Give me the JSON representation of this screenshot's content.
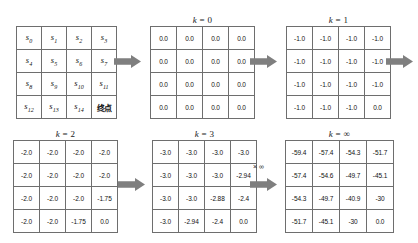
{
  "figure": {
    "panels": [
      {
        "id": "states",
        "caption": "",
        "caption_var": "",
        "caption_rest": "",
        "kind": "states",
        "rows": [
          [
            "s0",
            "s1",
            "s2",
            "s3"
          ],
          [
            "s4",
            "s5",
            "s6",
            "s7"
          ],
          [
            "s8",
            "s9",
            "s10",
            "s11"
          ],
          [
            "s12",
            "s13",
            "s14",
            "终点"
          ]
        ],
        "cells": [
          [
            {
              "base": "s",
              "sub": "0"
            },
            {
              "base": "s",
              "sub": "1"
            },
            {
              "base": "s",
              "sub": "2"
            },
            {
              "base": "s",
              "sub": "3"
            }
          ],
          [
            {
              "base": "s",
              "sub": "4"
            },
            {
              "base": "s",
              "sub": "5"
            },
            {
              "base": "s",
              "sub": "6"
            },
            {
              "base": "s",
              "sub": "7"
            }
          ],
          [
            {
              "base": "s",
              "sub": "8"
            },
            {
              "base": "s",
              "sub": "9"
            },
            {
              "base": "s",
              "sub": "10"
            },
            {
              "base": "s",
              "sub": "11"
            }
          ],
          [
            {
              "base": "s",
              "sub": "12"
            },
            {
              "base": "s",
              "sub": "13"
            },
            {
              "base": "s",
              "sub": "14"
            },
            {
              "base": "终点",
              "sub": ""
            }
          ]
        ]
      },
      {
        "id": "k0",
        "caption": "k = 0",
        "caption_var": "k",
        "caption_rest": " = 0",
        "kind": "values",
        "rows": [
          [
            "0.0",
            "0.0",
            "0.0",
            "0.0"
          ],
          [
            "0.0",
            "0.0",
            "0.0",
            "0.0"
          ],
          [
            "0.0",
            "0.0",
            "0.0",
            "0.0"
          ],
          [
            "0.0",
            "0.0",
            "0.0",
            "0.0"
          ]
        ]
      },
      {
        "id": "k1",
        "caption": "k = 1",
        "caption_var": "k",
        "caption_rest": " = 1",
        "kind": "values",
        "rows": [
          [
            "-1.0",
            "-1.0",
            "-1.0",
            "-1.0"
          ],
          [
            "-1.0",
            "-1.0",
            "-1.0",
            "-1.0"
          ],
          [
            "-1.0",
            "-1.0",
            "-1.0",
            "-1.0"
          ],
          [
            "-1.0",
            "-1.0",
            "-1.0",
            "0.0"
          ]
        ]
      },
      {
        "id": "k2",
        "caption": "k = 2",
        "caption_var": "k",
        "caption_rest": " = 2",
        "kind": "values",
        "rows": [
          [
            "-2.0",
            "-2.0",
            "-2.0",
            "-2.0"
          ],
          [
            "-2.0",
            "-2.0",
            "-2.0",
            "-2.0"
          ],
          [
            "-2.0",
            "-2.0",
            "-2.0",
            "-1.75"
          ],
          [
            "-2.0",
            "-2.0",
            "-1.75",
            "0.0"
          ]
        ]
      },
      {
        "id": "k3",
        "caption": "k = 3",
        "caption_var": "k",
        "caption_rest": " = 3",
        "kind": "values",
        "rows": [
          [
            "-3.0",
            "-3.0",
            "-3.0",
            "-3.0"
          ],
          [
            "-3.0",
            "-3.0",
            "-3.0",
            "-2.94"
          ],
          [
            "-3.0",
            "-3.0",
            "-2.88",
            "-2.4"
          ],
          [
            "-3.0",
            "-2.94",
            "-2.4",
            "0.0"
          ]
        ]
      },
      {
        "id": "kinf",
        "caption": "k = ∞",
        "caption_var": "k",
        "caption_rest": " = ∞",
        "kind": "values",
        "rows": [
          [
            "-59.4",
            "-57.4",
            "-54.3",
            "-51.7"
          ],
          [
            "-57.4",
            "-54.6",
            "-49.7",
            "-45.1"
          ],
          [
            "-54.3",
            "-49.7",
            "-40.9",
            "-30"
          ],
          [
            "-51.7",
            "-45.1",
            "-30",
            "0.0"
          ]
        ]
      }
    ],
    "arrows": [
      {
        "id": "arrow-states-to-k0",
        "label": ""
      },
      {
        "id": "arrow-k0-to-k1",
        "label": ""
      },
      {
        "id": "arrow-k1-to-next",
        "label": ""
      },
      {
        "id": "arrow-k2-to-k3",
        "label": ""
      },
      {
        "id": "arrow-k3-to-kinf",
        "label": "× ∞"
      }
    ],
    "arrow_infinity_label": "× ∞",
    "colors": {
      "arrow_fill": "#7f7f7f",
      "grid_outer_border": "#4a4a4a",
      "grid_inner_border": "#6e6e6e",
      "text": "#111111",
      "background": "#ffffff"
    }
  }
}
